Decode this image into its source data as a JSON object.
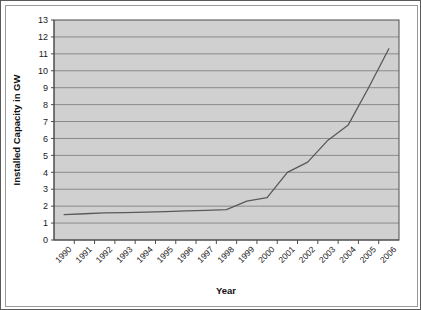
{
  "chart_data": {
    "type": "line",
    "title": "",
    "xlabel": "Year",
    "ylabel": "Installed Capacity in GW",
    "categories": [
      "1990",
      "1991",
      "1992",
      "1993",
      "1994",
      "1995",
      "1996",
      "1997",
      "1998",
      "1999",
      "2000",
      "2001",
      "2002",
      "2003",
      "2004",
      "2005",
      "2006"
    ],
    "x": [
      1990,
      1991,
      1992,
      1993,
      1994,
      1995,
      1996,
      1997,
      1998,
      1999,
      2000,
      2001,
      2002,
      2003,
      2004,
      2005,
      2006
    ],
    "values": [
      1.5,
      1.55,
      1.6,
      1.62,
      1.65,
      1.68,
      1.72,
      1.75,
      1.8,
      2.3,
      2.5,
      4.0,
      4.6,
      5.9,
      6.8,
      9.0,
      11.3
    ],
    "series": [
      {
        "name": "Installed Capacity",
        "values": [
          1.5,
          1.55,
          1.6,
          1.62,
          1.65,
          1.68,
          1.72,
          1.75,
          1.8,
          2.3,
          2.5,
          4.0,
          4.6,
          5.9,
          6.8,
          9.0,
          11.3
        ]
      }
    ],
    "ylim": [
      0,
      13
    ],
    "yticks": [
      0,
      1,
      2,
      3,
      4,
      5,
      6,
      7,
      8,
      9,
      10,
      11,
      12,
      13
    ],
    "ytick_labels": [
      "0",
      "1",
      "2",
      "3",
      "4",
      "5",
      "6",
      "7",
      "8",
      "9",
      "10",
      "11",
      "12",
      "13"
    ],
    "grid": "horizontal",
    "legend": "none",
    "plot_background": "#d0d0d0",
    "line_color": "#595959",
    "grid_color": "#8a8a8a",
    "axis_color": "#4d4d4d",
    "border_color": "#5a5a5a"
  }
}
